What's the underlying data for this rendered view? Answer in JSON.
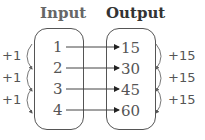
{
  "headers": {
    "input": "Input",
    "output": "Output"
  },
  "inputs": [
    "1",
    "2",
    "3",
    "4"
  ],
  "outputs": [
    "15",
    "30",
    "45",
    "60"
  ],
  "input_steps": [
    "+1",
    "+1",
    "+1"
  ],
  "output_steps": [
    "+15",
    "+15",
    "+15"
  ]
}
